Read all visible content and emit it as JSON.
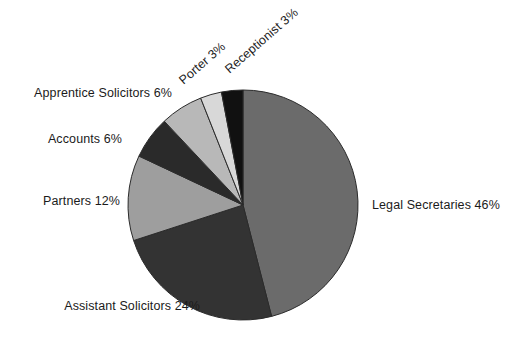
{
  "chart_data": {
    "type": "pie",
    "title": "",
    "xlabel": "",
    "ylabel": "",
    "legend_position": "none",
    "grid": false,
    "start_angle_deg": 0,
    "direction": "clockwise",
    "categories": [
      "Legal Secretaries",
      "Assistant Solicitors",
      "Partners",
      "Accounts",
      "Apprentice Solicitors",
      "Porter",
      "Receptionist"
    ],
    "values": [
      46,
      24,
      12,
      6,
      6,
      3,
      3
    ],
    "unit": "%",
    "total": 100,
    "colors": [
      "#6b6b6b",
      "#333333",
      "#9e9e9e",
      "#2a2a2a",
      "#b8b8b8",
      "#d8d8d8",
      "#111111"
    ],
    "slices": [
      {
        "name": "Legal Secretaries",
        "value": 46,
        "label": "Legal Secretaries 46%",
        "color": "#6b6b6b"
      },
      {
        "name": "Assistant Solicitors",
        "value": 24,
        "label": "Assistant Solicitors 24%",
        "color": "#333333"
      },
      {
        "name": "Partners",
        "value": 12,
        "label": "Partners 12%",
        "color": "#9e9e9e"
      },
      {
        "name": "Accounts",
        "value": 6,
        "label": "Accounts 6%",
        "color": "#2a2a2a"
      },
      {
        "name": "Apprentice Solicitors",
        "value": 6,
        "label": "Apprentice Solicitors 6%",
        "color": "#b8b8b8"
      },
      {
        "name": "Porter",
        "value": 3,
        "label": "Porter 3%",
        "color": "#d8d8d8"
      },
      {
        "name": "Receptionist",
        "value": 3,
        "label": "Receptionist 3%",
        "color": "#111111"
      }
    ]
  },
  "labels": {
    "legal_secretaries": "Legal Secretaries 46%",
    "assistant_solicitors": "Assistant Solicitors 24%",
    "partners": "Partners 12%",
    "accounts": "Accounts 6%",
    "apprentice_solicitors": "Apprentice Solicitors 6%",
    "porter": "Porter 3%",
    "receptionist": "Receptionist 3%"
  },
  "geometry": {
    "center_x": 243,
    "center_y": 205,
    "radius": 115,
    "background": "#ffffff",
    "outline": "#2b2b2b"
  }
}
